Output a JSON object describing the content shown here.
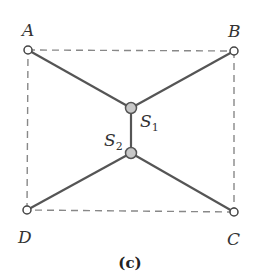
{
  "diagram": {
    "caption": "(c)",
    "points": {
      "A": {
        "label": "A",
        "x": 28,
        "y": 50
      },
      "B": {
        "label": "B",
        "x": 234,
        "y": 51
      },
      "C": {
        "label": "C",
        "x": 234,
        "y": 212
      },
      "D": {
        "label": "D",
        "x": 27,
        "y": 210
      }
    },
    "nodes": {
      "S1": {
        "label": "S",
        "subscript": "1",
        "x": 131,
        "y": 108
      },
      "S2": {
        "label": "S",
        "subscript": "2",
        "x": 131,
        "y": 153
      }
    },
    "edges": [
      {
        "from": "A",
        "to": "S1"
      },
      {
        "from": "B",
        "to": "S1"
      },
      {
        "from": "S1",
        "to": "S2"
      },
      {
        "from": "D",
        "to": "S2"
      },
      {
        "from": "C",
        "to": "S2"
      }
    ],
    "dashed_boundary": [
      "A",
      "B",
      "C",
      "D"
    ],
    "colors": {
      "solid_line": "#555555",
      "dashed_line": "#888888",
      "node_fill": "#c8c8c8",
      "corner_fill": "#ffffff",
      "stroke": "#444444"
    }
  }
}
